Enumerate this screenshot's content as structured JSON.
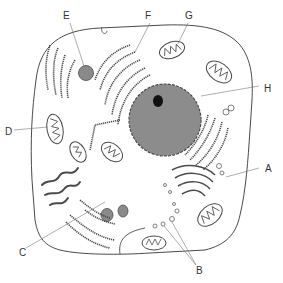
{
  "diagram": {
    "colors": {
      "line": "#4a4a4a",
      "organelle_fill": "#8a8a8a",
      "nucleus_fill": "#8c8c8c",
      "nucleolus_fill": "#111111",
      "background": "#ffffff"
    },
    "labels": [
      {
        "id": "A",
        "text": "A",
        "x": 265,
        "y": 172,
        "target": "vesicles / Golgi region"
      },
      {
        "id": "B",
        "text": "B",
        "x": 199,
        "y": 272,
        "target": "small vesicles"
      },
      {
        "id": "C",
        "text": "C",
        "x": 20,
        "y": 253,
        "target": "rough endoplasmic reticulum"
      },
      {
        "id": "D",
        "text": "D",
        "x": 5,
        "y": 134,
        "target": "mitochondrion"
      },
      {
        "id": "E",
        "text": "E",
        "x": 63,
        "y": 18,
        "target": "lysosome"
      },
      {
        "id": "F",
        "text": "F",
        "x": 146,
        "y": 18,
        "target": "rough endoplasmic reticulum"
      },
      {
        "id": "G",
        "text": "G",
        "x": 186,
        "y": 18,
        "target": "mitochondrion"
      },
      {
        "id": "H",
        "text": "H",
        "x": 263,
        "y": 89,
        "target": "nucleus"
      }
    ]
  }
}
